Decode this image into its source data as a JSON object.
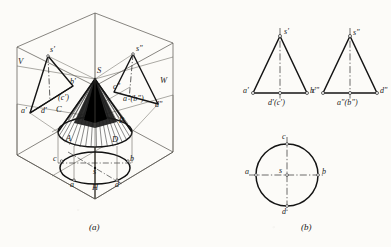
{
  "figure": {
    "caption_left": "(a)",
    "caption_right": "(b)",
    "type": "descriptive-geometry-cone-projection"
  },
  "pictorial": {
    "planes": {
      "vertical_plane_label": "V",
      "profile_plane_label": "W",
      "horizontal_plane_label": "H"
    },
    "solid_labels": {
      "apex": "S",
      "base_front_left": "A",
      "base_right": "B",
      "base_left": "C",
      "base_front_right": "D"
    },
    "front_projection_labels": {
      "apex": "s'",
      "left": "a'",
      "right": "b'",
      "center_front": "d'",
      "center_hidden": "(c')"
    },
    "side_projection_labels": {
      "apex": "s\"",
      "left": "c\"",
      "right": "d\"",
      "center": "a\"(b\")"
    },
    "top_projection_labels": {
      "center": "s",
      "left": "c",
      "right": "b",
      "front": "a",
      "back": "d"
    }
  },
  "orthographic": {
    "front_view": {
      "name": "front-view",
      "apex": "s'",
      "left_vertex": "a'",
      "right_vertex": "b'",
      "base_center": "d'(c')"
    },
    "side_view": {
      "name": "side-view",
      "apex": "s\"",
      "left_vertex": "c\"",
      "right_vertex": "d\"",
      "base_center": "a\"(b\")"
    },
    "top_view": {
      "name": "top-view",
      "center": "s",
      "top": "c",
      "bottom": "d",
      "left": "a",
      "right": "b"
    }
  },
  "colors": {
    "line": "#1c1c1c",
    "thin_line": "#4a4a46",
    "paper": "#fcfbf8"
  }
}
